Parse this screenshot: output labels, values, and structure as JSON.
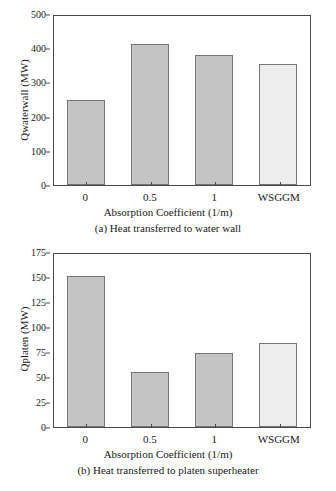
{
  "chart_data": [
    {
      "id": "a",
      "type": "bar",
      "title": "",
      "caption": "(a) Heat transferred to water wall",
      "xlabel": "Absorption Coefficient (1/m)",
      "ylabel": "Qwaterwall (MW)",
      "categories": [
        "0",
        "0.5",
        "1",
        "WSGGM"
      ],
      "values": [
        249,
        413,
        380,
        353
      ],
      "ylim": [
        0,
        500
      ],
      "yticks": [
        0,
        100,
        200,
        300,
        400,
        500
      ],
      "ytick_labels": [
        "0",
        "100",
        "200",
        "300",
        "400",
        "500"
      ],
      "grid": false,
      "legend": "none",
      "bar_colors": [
        "#c4c4c4",
        "#c4c4c4",
        "#c4c4c4",
        "#ededed"
      ],
      "bar_edge_color": "#777777"
    },
    {
      "id": "b",
      "type": "bar",
      "title": "",
      "caption": "(b) Heat transferred to platen superheater",
      "xlabel": "Absorption Coefficient (1/m)",
      "ylabel": "Qplaten (MW)",
      "categories": [
        "0",
        "0.5",
        "1",
        "WSGGM"
      ],
      "values": [
        151,
        55,
        74,
        84
      ],
      "ylim": [
        0,
        175
      ],
      "yticks": [
        0,
        25,
        50,
        75,
        100,
        125,
        150,
        175
      ],
      "ytick_labels": [
        "0",
        "25",
        "50",
        "75",
        "100",
        "125",
        "150",
        "175"
      ],
      "grid": false,
      "legend": "none",
      "bar_colors": [
        "#c4c4c4",
        "#c4c4c4",
        "#c4c4c4",
        "#ededed"
      ],
      "bar_edge_color": "#777777"
    }
  ]
}
